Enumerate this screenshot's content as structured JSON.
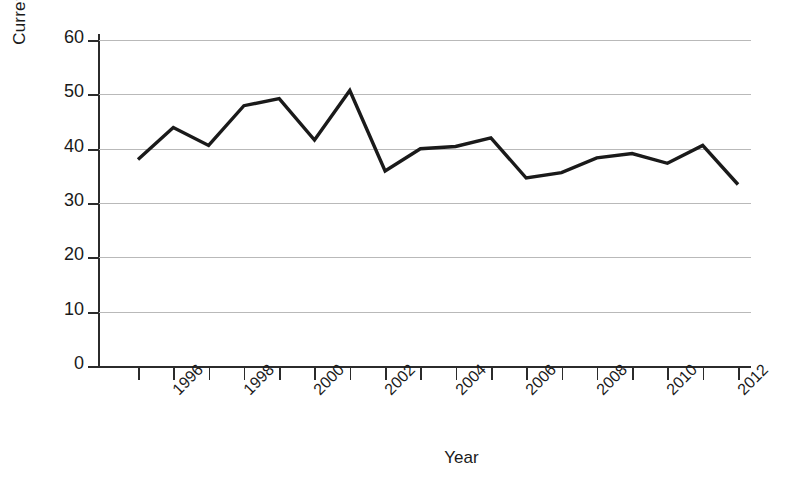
{
  "chart_data": {
    "type": "line",
    "title": "",
    "xlabel": "Year",
    "ylabel": "Currency/M1",
    "x": [
      1995,
      1996,
      1997,
      1998,
      1999,
      2000,
      2001,
      2002,
      2003,
      2004,
      2005,
      2006,
      2007,
      2008,
      2009,
      2010,
      2011,
      2012
    ],
    "values": [
      38.0,
      43.9,
      40.6,
      47.9,
      49.2,
      41.6,
      50.7,
      35.9,
      40.0,
      40.4,
      42.0,
      34.6,
      35.6,
      38.3,
      39.1,
      37.3,
      40.6,
      33.4
    ],
    "series": [
      {
        "name": "Currency/M1",
        "values": [
          38.0,
          43.9,
          40.6,
          47.9,
          49.2,
          41.6,
          50.7,
          35.9,
          40.0,
          40.4,
          42.0,
          34.6,
          35.6,
          38.3,
          39.1,
          37.3,
          40.6,
          33.4
        ]
      }
    ],
    "xlim": [
      1995,
      2012
    ],
    "ylim": [
      0,
      60
    ],
    "yticks": [
      0,
      10,
      20,
      30,
      40,
      50,
      60
    ],
    "ytick_labels": [
      "0",
      "10",
      "20",
      "30",
      "40",
      "50",
      "60"
    ],
    "xticks": [
      1995,
      1996,
      1997,
      1998,
      1999,
      2000,
      2001,
      2002,
      2003,
      2004,
      2005,
      2006,
      2007,
      2008,
      2009,
      2010,
      2011,
      2012
    ],
    "xtick_labels": [
      "",
      "1996",
      "",
      "1998",
      "",
      "2000",
      "",
      "2002",
      "",
      "2004",
      "",
      "2006",
      "",
      "2008",
      "",
      "2010",
      "",
      "2012"
    ],
    "grid": "horizontal",
    "legend": "none",
    "line_color": "#1a1a1a",
    "grid_color": "#b9b9b9",
    "axis_color": "#2b2b2b",
    "background_color": "#ffffff",
    "line_width": 3.4
  }
}
